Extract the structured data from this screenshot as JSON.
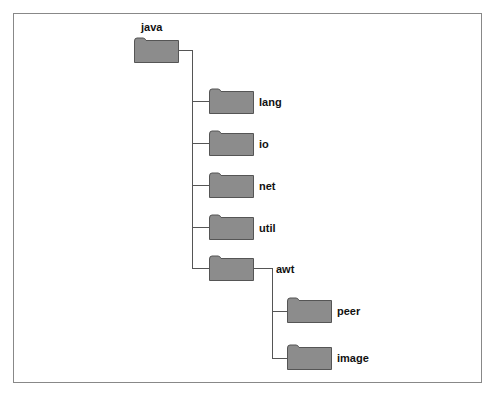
{
  "diagram": {
    "colors": {
      "folder_fill": "#8c8c8c",
      "folder_stroke": "#555555",
      "line": "#555555",
      "frame": "#888888"
    },
    "root": {
      "label": "java"
    },
    "children": [
      {
        "label": "lang"
      },
      {
        "label": "io"
      },
      {
        "label": "net"
      },
      {
        "label": "util"
      },
      {
        "label": "awt"
      }
    ],
    "awt_children": [
      {
        "label": "peer"
      },
      {
        "label": "image"
      }
    ]
  }
}
